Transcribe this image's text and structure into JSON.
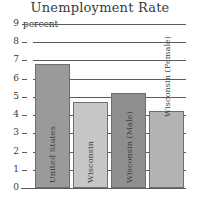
{
  "chart_data": {
    "type": "bar",
    "title": "Unemployment Rate",
    "xlabel": "",
    "ylabel": "percent",
    "ylim": [
      0,
      9
    ],
    "yticks": [
      "0",
      "1",
      "2",
      "3",
      "4",
      "5",
      "6",
      "7",
      "8",
      "9"
    ],
    "grid": true,
    "legend": "none",
    "categories": [
      "United States",
      "Wisconsin",
      "Wisconsin (Male)",
      "Wisconsin (Female)"
    ],
    "values": [
      6.8,
      4.7,
      5.2,
      4.2
    ],
    "bars": [
      {
        "label": "United States",
        "value": 6.8,
        "color": "#9a9a9a",
        "label_position": "inside"
      },
      {
        "label": "Wisconsin",
        "value": 4.7,
        "color": "#c6c6c6",
        "label_position": "inside"
      },
      {
        "label": "Wisconsin (Male)",
        "value": 5.2,
        "color": "#8f8f8f",
        "label_position": "inside"
      },
      {
        "label": "Wisconsin (Female)",
        "value": 4.2,
        "color": "#b4b4b4",
        "label_position": "outside"
      }
    ]
  },
  "colors": {
    "axis": "#5c5c5c",
    "text": "#3a3a3a",
    "background": "#ffffff"
  }
}
